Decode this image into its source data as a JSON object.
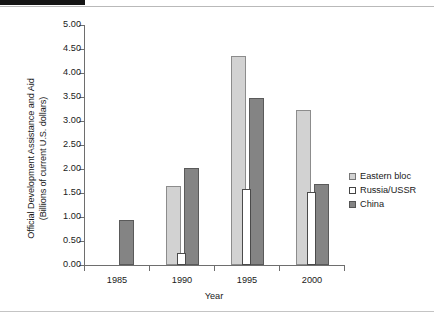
{
  "figure": {
    "y_axis_title_line1": "Official Development Assistance and Aid",
    "y_axis_title_line2": "(Billions of current U.S. dollars)",
    "x_axis_title": "Year"
  },
  "legend": {
    "position": "right",
    "items": [
      {
        "label": "Eastern bloc",
        "color": "#d2d2d2",
        "swatch": "eastern"
      },
      {
        "label": "Russia/USSR",
        "color": "#ffffff",
        "swatch": "russia"
      },
      {
        "label": "China",
        "color": "#848484",
        "swatch": "china"
      }
    ]
  },
  "chart_data": {
    "type": "bar",
    "title": "",
    "subtitle": "",
    "xlabel": "Year",
    "ylabel": "Official Development Assistance and Aid (Billions of current U.S. dollars)",
    "categories": [
      "1985",
      "1990",
      "1995",
      "2000"
    ],
    "series": [
      {
        "name": "Eastern bloc",
        "color": "#d2d2d2",
        "values": [
          null,
          1.65,
          4.35,
          3.23
        ]
      },
      {
        "name": "Russia/USSR",
        "color": "#ffffff",
        "values": [
          null,
          0.24,
          1.58,
          1.53
        ]
      },
      {
        "name": "China",
        "color": "#848484",
        "values": [
          0.94,
          2.02,
          3.47,
          1.68
        ]
      }
    ],
    "ylim": [
      0.0,
      5.0
    ],
    "ytick_step": 0.5,
    "ytick_labels": [
      "0.00",
      "0.50",
      "1.00",
      "1.50",
      "2.00",
      "2.50",
      "3.00",
      "3.50",
      "4.00",
      "4.50",
      "5.00"
    ],
    "xtick_labels": [
      "1985",
      "1990",
      "1995",
      "2000"
    ],
    "grid": false,
    "legend_position": "right"
  }
}
